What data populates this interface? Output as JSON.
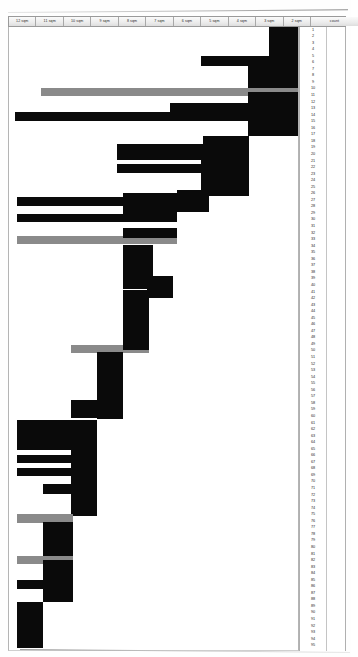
{
  "document": {
    "type": "scanned-bar-chart-sheet",
    "title": "",
    "background_color": "#ffffff"
  },
  "header": {
    "columns": [
      {
        "label": "12 sqm"
      },
      {
        "label": "11 sqm"
      },
      {
        "label": "10 sqm"
      },
      {
        "label": "9 sqm"
      },
      {
        "label": "8 sqm"
      },
      {
        "label": "7 sqm"
      },
      {
        "label": "6 sqm"
      },
      {
        "label": "5 sqm"
      },
      {
        "label": "4 sqm"
      },
      {
        "label": "3 sqm"
      },
      {
        "label": "2 sqm"
      },
      {
        "label": "count"
      }
    ]
  },
  "colors": {
    "bar_primary": "#0a0a0a",
    "bar_secondary": "#8a8a8a",
    "grid_line": "#b4b4b4",
    "header_fill": "#ececec",
    "text": "#1f1f1f"
  },
  "chart_data": {
    "type": "bar",
    "orientation": "horizontal",
    "title": "",
    "xlabel": "",
    "ylabel": "",
    "xlim": [
      2,
      12
    ],
    "axis_direction": "descending-left-to-right",
    "grid": true,
    "legend_position": "none",
    "note": "Bars are right-aligned at the axis origin and extend leftward; value = leftward extent in sqm units. Series 'gray' marks highlighted rows.",
    "categories": [
      1,
      2,
      3,
      4,
      5,
      6,
      7,
      8,
      9,
      10,
      11,
      12,
      13,
      14,
      15,
      16,
      17,
      18,
      19,
      20,
      21,
      22,
      23,
      24,
      25,
      26,
      27,
      28,
      29,
      30,
      31,
      32,
      33,
      34,
      35,
      36,
      37,
      38,
      39,
      40,
      41,
      42,
      43,
      44,
      45,
      46,
      47,
      48,
      49,
      50,
      51,
      52,
      53,
      54,
      55,
      56,
      57,
      58,
      59,
      60,
      61,
      62,
      63,
      64,
      65,
      66,
      67,
      68,
      69,
      70,
      71,
      72,
      73,
      74,
      75,
      76,
      77,
      78,
      79,
      80,
      81,
      82,
      83,
      84,
      85,
      86,
      87,
      88,
      89,
      90,
      91,
      92,
      93,
      94,
      95
    ],
    "bars": [
      {
        "row": 1,
        "start": 0.0,
        "length": 9.0,
        "color": "#0a0a0a"
      },
      {
        "row": 2,
        "start": 0.0,
        "length": 9.0,
        "color": "#0a0a0a"
      },
      {
        "row": 3,
        "start": 0.0,
        "length": 9.0,
        "color": "#0a0a0a"
      },
      {
        "row": 4,
        "start": 0.0,
        "length": 9.0,
        "color": "#0a0a0a"
      },
      {
        "row": 5,
        "start": 0.0,
        "length": 9.0,
        "color": "#0a0a0a"
      },
      {
        "row": 6,
        "start": 0.0,
        "length": 9.0,
        "color": "#0a0a0a"
      },
      {
        "row": 7,
        "start": 0.0,
        "length": 35.0,
        "color": "#0a0a0a"
      },
      {
        "row": 8,
        "start": 0.0,
        "length": 35.0,
        "color": "#0a0a0a"
      },
      {
        "row": 9,
        "start": 0.0,
        "length": 35.0,
        "color": "#0a0a0a"
      },
      {
        "row": 10,
        "start": 0.0,
        "length": 18.0,
        "color": "#0a0a0a"
      },
      {
        "row": 11,
        "start": 0.0,
        "length": 81.0,
        "color": "#8a8a8a"
      },
      {
        "row": 12,
        "start": 0.0,
        "length": 81.0,
        "color": "#8a8a8a"
      },
      {
        "row": 13,
        "start": 0.0,
        "length": 18.0,
        "color": "#0a0a0a"
      },
      {
        "row": 14,
        "start": 0.0,
        "length": 60.0,
        "color": "#0a0a0a"
      },
      {
        "row": 15,
        "start": 0.0,
        "length": 60.0,
        "color": "#0a0a0a"
      },
      {
        "row": 16,
        "start": 0.0,
        "length": 91.0,
        "color": "#0a0a0a"
      },
      {
        "row": 17,
        "start": 0.0,
        "length": 91.0,
        "color": "#0a0a0a"
      },
      {
        "row": 18,
        "start": 0.0,
        "length": 18.0,
        "color": "#0a0a0a"
      },
      {
        "row": 19,
        "start": 0.0,
        "length": 18.0,
        "color": "#0a0a0a"
      },
      {
        "row": 20,
        "start": 0.0,
        "length": 44.0,
        "color": "#0a0a0a"
      },
      {
        "row": 21,
        "start": 0.0,
        "length": 44.0,
        "color": "#0a0a0a"
      },
      {
        "row": 22,
        "start": 0.0,
        "length": 44.0,
        "color": "#0a0a0a"
      },
      {
        "row": 23,
        "start": 0.0,
        "length": 25.0,
        "color": "#0a0a0a"
      },
      {
        "row": 24,
        "start": 0.0,
        "length": 44.0,
        "color": "#0a0a0a"
      },
      {
        "row": 25,
        "start": 0.0,
        "length": 44.0,
        "color": "#0a0a0a"
      },
      {
        "row": 26,
        "start": 0.0,
        "length": 25.0,
        "color": "#0a0a0a"
      },
      {
        "row": 27,
        "start": 0.0,
        "length": 25.0,
        "color": "#0a0a0a"
      },
      {
        "row": 28,
        "start": 0.0,
        "length": 38.0,
        "color": "#0a0a0a"
      },
      {
        "row": 29,
        "start": 0.0,
        "length": 88.0,
        "color": "#0a0a0a"
      },
      {
        "row": 30,
        "start": 0.0,
        "length": 54.0,
        "color": "#0a0a0a"
      },
      {
        "row": 31,
        "start": 0.0,
        "length": 88.0,
        "color": "#0a0a0a"
      },
      {
        "row": 32,
        "start": 0.0,
        "length": 54.0,
        "color": "#0a0a0a"
      },
      {
        "row": 33,
        "start": 0.0,
        "length": 88.0,
        "color": "#8a8a8a"
      },
      {
        "row": 34,
        "start": 0.0,
        "length": 88.0,
        "color": "#8a8a8a"
      },
      {
        "row": 35,
        "start": 0.0,
        "length": 54.0,
        "color": "#0a0a0a"
      },
      {
        "row": 36,
        "start": 0.0,
        "length": 54.0,
        "color": "#0a0a0a"
      },
      {
        "row": 37,
        "start": 0.0,
        "length": 54.0,
        "color": "#0a0a0a"
      },
      {
        "row": 38,
        "start": 0.0,
        "length": 54.0,
        "color": "#0a0a0a"
      },
      {
        "row": 39,
        "start": 0.0,
        "length": 54.0,
        "color": "#0a0a0a"
      },
      {
        "row": 40,
        "start": 0.0,
        "length": 54.0,
        "color": "#0a0a0a"
      },
      {
        "row": 41,
        "start": 0.0,
        "length": 54.0,
        "color": "#0a0a0a"
      },
      {
        "row": 42,
        "start": 0.0,
        "length": 54.0,
        "color": "#0a0a0a"
      },
      {
        "row": 43,
        "start": 0.0,
        "length": 54.0,
        "color": "#0a0a0a"
      },
      {
        "row": 44,
        "start": 0.0,
        "length": 54.0,
        "color": "#0a0a0a"
      },
      {
        "row": 45,
        "start": 0.0,
        "length": 54.0,
        "color": "#0a0a0a"
      },
      {
        "row": 46,
        "start": 0.0,
        "length": 45.0,
        "color": "#0a0a0a"
      },
      {
        "row": 47,
        "start": 0.0,
        "length": 45.0,
        "color": "#0a0a0a"
      },
      {
        "row": 48,
        "start": 0.0,
        "length": 45.0,
        "color": "#0a0a0a"
      },
      {
        "row": 49,
        "start": 0.0,
        "length": 70.0,
        "color": "#8a8a8a"
      },
      {
        "row": 50,
        "start": 0.0,
        "length": 70.0,
        "color": "#8a8a8a"
      },
      {
        "row": 51,
        "start": 0.0,
        "length": 38.0,
        "color": "#0a0a0a"
      },
      {
        "row": 52,
        "start": 0.0,
        "length": 38.0,
        "color": "#0a0a0a"
      },
      {
        "row": 53,
        "start": 0.0,
        "length": 38.0,
        "color": "#0a0a0a"
      },
      {
        "row": 54,
        "start": 0.0,
        "length": 38.0,
        "color": "#0a0a0a"
      },
      {
        "row": 55,
        "start": 0.0,
        "length": 38.0,
        "color": "#0a0a0a"
      },
      {
        "row": 56,
        "start": 0.0,
        "length": 38.0,
        "color": "#0a0a0a"
      },
      {
        "row": 57,
        "start": 0.0,
        "length": 38.0,
        "color": "#0a0a0a"
      },
      {
        "row": 58,
        "start": 0.0,
        "length": 38.0,
        "color": "#0a0a0a"
      },
      {
        "row": 59,
        "start": 0.0,
        "length": 30.0,
        "color": "#0a0a0a"
      },
      {
        "row": 60,
        "start": 0.0,
        "length": 30.0,
        "color": "#0a0a0a"
      },
      {
        "row": 61,
        "start": 0.0,
        "length": 30.0,
        "color": "#0a0a0a"
      },
      {
        "row": 62,
        "start": 0.0,
        "length": 30.0,
        "color": "#0a0a0a"
      },
      {
        "row": 63,
        "start": 0.0,
        "length": 95.0,
        "color": "#0a0a0a"
      },
      {
        "row": 64,
        "start": 0.0,
        "length": 95.0,
        "color": "#0a0a0a"
      },
      {
        "row": 65,
        "start": 0.0,
        "length": 95.0,
        "color": "#0a0a0a"
      },
      {
        "row": 66,
        "start": 0.0,
        "length": 95.0,
        "color": "#0a0a0a"
      },
      {
        "row": 67,
        "start": 0.0,
        "length": 78.0,
        "color": "#0a0a0a"
      },
      {
        "row": 68,
        "start": 0.0,
        "length": 95.0,
        "color": "#0a0a0a"
      },
      {
        "row": 69,
        "start": 0.0,
        "length": 78.0,
        "color": "#0a0a0a"
      },
      {
        "row": 70,
        "start": 0.0,
        "length": 95.0,
        "color": "#0a0a0a"
      },
      {
        "row": 71,
        "start": 0.0,
        "length": 95.0,
        "color": "#0a0a0a"
      },
      {
        "row": 72,
        "start": 0.0,
        "length": 62.0,
        "color": "#0a0a0a"
      },
      {
        "row": 73,
        "start": 0.0,
        "length": 62.0,
        "color": "#0a0a0a"
      },
      {
        "row": 74,
        "start": 0.0,
        "length": 78.0,
        "color": "#0a0a0a"
      },
      {
        "row": 75,
        "start": 0.0,
        "length": 62.0,
        "color": "#0a0a0a"
      },
      {
        "row": 76,
        "start": 0.0,
        "length": 78.0,
        "color": "#8a8a8a"
      },
      {
        "row": 77,
        "start": 0.0,
        "length": 62.0,
        "color": "#0a0a0a"
      },
      {
        "row": 78,
        "start": 0.0,
        "length": 62.0,
        "color": "#0a0a0a"
      },
      {
        "row": 79,
        "start": 0.0,
        "length": 78.0,
        "color": "#0a0a0a"
      },
      {
        "row": 80,
        "start": 0.0,
        "length": 62.0,
        "color": "#0a0a0a"
      },
      {
        "row": 81,
        "start": 0.0,
        "length": 78.0,
        "color": "#8a8a8a"
      },
      {
        "row": 82,
        "start": 0.0,
        "length": 62.0,
        "color": "#0a0a0a"
      },
      {
        "row": 83,
        "start": 0.0,
        "length": 62.0,
        "color": "#0a0a0a"
      },
      {
        "row": 84,
        "start": 0.0,
        "length": 78.0,
        "color": "#0a0a0a"
      },
      {
        "row": 85,
        "start": 0.0,
        "length": 62.0,
        "color": "#0a0a0a"
      },
      {
        "row": 86,
        "start": 0.0,
        "length": 62.0,
        "color": "#0a0a0a"
      },
      {
        "row": 87,
        "start": 0.0,
        "length": 78.0,
        "color": "#0a0a0a"
      },
      {
        "row": 88,
        "start": 0.0,
        "length": 30.0,
        "color": "#0a0a0a"
      },
      {
        "row": 89,
        "start": 0.0,
        "length": 30.0,
        "color": "#0a0a0a"
      },
      {
        "row": 90,
        "start": 0.0,
        "length": 30.0,
        "color": "#0a0a0a"
      },
      {
        "row": 91,
        "start": 0.0,
        "length": 30.0,
        "color": "#0a0a0a"
      },
      {
        "row": 92,
        "start": 0.0,
        "length": 30.0,
        "color": "#0a0a0a"
      },
      {
        "row": 93,
        "start": 0.0,
        "length": 30.0,
        "color": "#0a0a0a"
      },
      {
        "row": 94,
        "start": 0.0,
        "length": 30.0,
        "color": "#0a0a0a"
      },
      {
        "row": 95,
        "start": 0.0,
        "length": 30.0,
        "color": "#0a0a0a"
      }
    ]
  },
  "geometry": {
    "plot": {
      "left": 8,
      "top": 26.5,
      "width": 291,
      "height": 624
    },
    "row_pitch": 6.55,
    "segments": [
      {
        "x": 268,
        "y": 27,
        "w": 30,
        "h": 39,
        "c": "#0a0a0a"
      },
      {
        "x": 200,
        "y": 56,
        "w": 98,
        "h": 10,
        "c": "#0a0a0a"
      },
      {
        "x": 247,
        "y": 66,
        "w": 51,
        "h": 26,
        "c": "#0a0a0a"
      },
      {
        "x": 40,
        "y": 88,
        "w": 232,
        "h": 8,
        "c": "#8a8a8a"
      },
      {
        "x": 247,
        "y": 88,
        "w": 51,
        "h": 8,
        "c": "#8a8a8a"
      },
      {
        "x": 247,
        "y": 92,
        "w": 51,
        "h": 14,
        "c": "#0a0a0a"
      },
      {
        "x": 169,
        "y": 103,
        "w": 80,
        "h": 9,
        "c": "#0a0a0a"
      },
      {
        "x": 14,
        "y": 112,
        "w": 235,
        "h": 9,
        "c": "#0a0a0a"
      },
      {
        "x": 247,
        "y": 106,
        "w": 51,
        "h": 30,
        "c": "#0a0a0a"
      },
      {
        "x": 116,
        "y": 144,
        "w": 86,
        "h": 16,
        "c": "#0a0a0a"
      },
      {
        "x": 202,
        "y": 136,
        "w": 46,
        "h": 28,
        "c": "#0a0a0a"
      },
      {
        "x": 116,
        "y": 164,
        "w": 132,
        "h": 9,
        "c": "#0a0a0a"
      },
      {
        "x": 200,
        "y": 160,
        "w": 48,
        "h": 36,
        "c": "#0a0a0a"
      },
      {
        "x": 16,
        "y": 197,
        "w": 106,
        "h": 9,
        "c": "#0a0a0a"
      },
      {
        "x": 122,
        "y": 193,
        "w": 54,
        "h": 28,
        "c": "#0a0a0a"
      },
      {
        "x": 176,
        "y": 190,
        "w": 32,
        "h": 22,
        "c": "#0a0a0a"
      },
      {
        "x": 16,
        "y": 214,
        "w": 160,
        "h": 8,
        "c": "#0a0a0a"
      },
      {
        "x": 16,
        "y": 236,
        "w": 160,
        "h": 8,
        "c": "#8a8a8a"
      },
      {
        "x": 122,
        "y": 228,
        "w": 54,
        "h": 10,
        "c": "#0a0a0a"
      },
      {
        "x": 122,
        "y": 245,
        "w": 30,
        "h": 44,
        "c": "#0a0a0a"
      },
      {
        "x": 146,
        "y": 276,
        "w": 26,
        "h": 22,
        "c": "#0a0a0a"
      },
      {
        "x": 70,
        "y": 345,
        "w": 78,
        "h": 8,
        "c": "#8a8a8a"
      },
      {
        "x": 122,
        "y": 290,
        "w": 26,
        "h": 60,
        "c": "#0a0a0a"
      },
      {
        "x": 96,
        "y": 352,
        "w": 26,
        "h": 58,
        "c": "#0a0a0a"
      },
      {
        "x": 70,
        "y": 400,
        "w": 52,
        "h": 18,
        "c": "#0a0a0a"
      },
      {
        "x": 96,
        "y": 393,
        "w": 26,
        "h": 26,
        "c": "#0a0a0a"
      },
      {
        "x": 16,
        "y": 420,
        "w": 76,
        "h": 30,
        "c": "#0a0a0a"
      },
      {
        "x": 16,
        "y": 455,
        "w": 56,
        "h": 8,
        "c": "#0a0a0a"
      },
      {
        "x": 16,
        "y": 468,
        "w": 56,
        "h": 8,
        "c": "#0a0a0a"
      },
      {
        "x": 70,
        "y": 420,
        "w": 26,
        "h": 96,
        "c": "#0a0a0a"
      },
      {
        "x": 42,
        "y": 484,
        "w": 30,
        "h": 10,
        "c": "#0a0a0a"
      },
      {
        "x": 16,
        "y": 514,
        "w": 56,
        "h": 9,
        "c": "#8a8a8a"
      },
      {
        "x": 42,
        "y": 522,
        "w": 30,
        "h": 40,
        "c": "#0a0a0a"
      },
      {
        "x": 16,
        "y": 556,
        "w": 56,
        "h": 8,
        "c": "#8a8a8a"
      },
      {
        "x": 42,
        "y": 560,
        "w": 30,
        "h": 42,
        "c": "#0a0a0a"
      },
      {
        "x": 16,
        "y": 580,
        "w": 26,
        "h": 9,
        "c": "#0a0a0a"
      },
      {
        "x": 16,
        "y": 602,
        "w": 26,
        "h": 46,
        "c": "#0a0a0a"
      }
    ]
  }
}
